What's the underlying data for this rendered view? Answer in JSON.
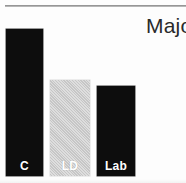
{
  "figure": {
    "heading_text": "Major",
    "rule_color": "#8f8f8f"
  },
  "chart_data": {
    "type": "bar",
    "title": "",
    "xlabel": "",
    "ylabel": "",
    "categories": [
      "C",
      "LD",
      "Lab"
    ],
    "values": [
      147,
      96,
      90
    ],
    "ylim": [
      0,
      154
    ],
    "grid": false,
    "legend": "none",
    "bar_colors": [
      "#0d0d0d",
      "#cccccc",
      "#0d0d0d"
    ],
    "label_colors": [
      "#ffffff",
      "#ffffff",
      "#ffffff"
    ]
  }
}
